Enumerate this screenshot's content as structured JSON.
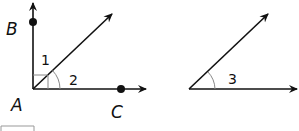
{
  "figure_left": {
    "points": {
      "vertex": "A",
      "top": "B",
      "right": "C"
    },
    "angle_labels": [
      "1",
      "2"
    ]
  },
  "figure_right": {
    "angle_labels": [
      "3"
    ]
  },
  "colors": {
    "line": "#111111",
    "arc": "#888888",
    "box": "#999999"
  }
}
